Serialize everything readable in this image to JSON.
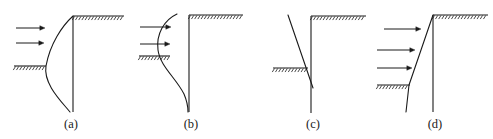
{
  "figure": {
    "type": "engineering-diagram",
    "width": 493,
    "height": 139,
    "background_color": "#ffffff",
    "line_color": "#1a1a1a",
    "label_color": "#1a1a1a"
  },
  "panels": [
    {
      "id": "a",
      "label": "(a)",
      "label_x": 51,
      "label_y": 117,
      "wall": {
        "x": 73,
        "y_top": 16,
        "y_bottom": 112
      },
      "retained_ground_line": {
        "x1": 73,
        "x2": 124,
        "y": 16,
        "hatch_side": "below"
      },
      "excavation_ground_line": {
        "x1": 14,
        "x2": 46,
        "y": 66,
        "hatch_side": "below"
      },
      "deflection_curve": "M 73 16 C 62 26 50 44 46 66 C 43 84 62 102 70 112",
      "deflection_shape": "cantilever-bulge-left",
      "arrows": [
        {
          "x1": 16,
          "x2": 45,
          "y": 28
        },
        {
          "x1": 16,
          "x2": 44,
          "y": 43
        }
      ],
      "arrow_count": 2
    },
    {
      "id": "b",
      "label": "(b)",
      "label_x": 171,
      "label_y": 117,
      "wall": {
        "x": 189,
        "y_top": 15,
        "y_bottom": 112
      },
      "retained_ground_line": {
        "x1": 189,
        "x2": 243,
        "y": 15,
        "hatch_side": "below"
      },
      "excavation_ground_line": {
        "x1": 139,
        "x2": 170,
        "y": 56,
        "hatch_side": "below"
      },
      "deflection_curve": "M 177 14 C 164 20 156 34 158 50 C 160 66 176 78 184 94 C 187 101 188 107 188 112",
      "deflection_shape": "braced-S-curve",
      "arrows": [
        {
          "x1": 140,
          "x2": 171,
          "y": 27
        },
        {
          "x1": 140,
          "x2": 170,
          "y": 44
        }
      ],
      "arrow_count": 2
    },
    {
      "id": "c",
      "label": "(c)",
      "label_x": 293,
      "label_y": 117,
      "wall": {
        "x": 311,
        "y_top": 16,
        "y_bottom": 113
      },
      "retained_ground_line": {
        "x1": 311,
        "x2": 366,
        "y": 16,
        "hatch_side": "below"
      },
      "excavation_ground_line": {
        "x1": 273,
        "x2": 308,
        "y": 68,
        "hatch_side": "below"
      },
      "deflection_curve": "M 288 15 L 313 88",
      "deflection_shape": "straight-inclined-rotation",
      "arrows": [],
      "arrow_count": 0
    },
    {
      "id": "d",
      "label": "(d)",
      "label_x": 415,
      "label_y": 117,
      "wall": {
        "x": 433,
        "y_top": 15,
        "y_bottom": 112
      },
      "retained_ground_line": {
        "x1": 433,
        "x2": 488,
        "y": 15,
        "hatch_side": "below"
      },
      "excavation_ground_line": {
        "x1": 377,
        "x2": 410,
        "y": 85,
        "hatch_side": "below"
      },
      "deflection_curve": "M 433 15 L 409 85 L 406 112",
      "deflection_shape": "straight-inclined-translation",
      "arrows": [
        {
          "x1": 384,
          "x2": 421,
          "y": 29
        },
        {
          "x1": 377,
          "x2": 415,
          "y": 50
        },
        {
          "x1": 377,
          "x2": 412,
          "y": 68
        }
      ],
      "arrow_count": 3
    }
  ],
  "hatch": {
    "tick_spacing": 3.2,
    "tick_length": 4.2,
    "tick_angle_deg": 58
  }
}
